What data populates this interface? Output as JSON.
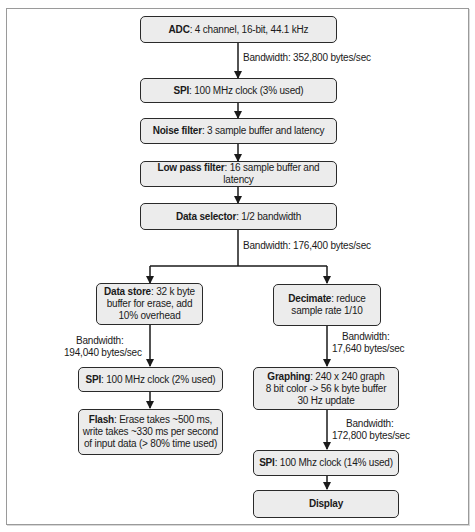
{
  "diagram": {
    "main": [
      {
        "id": "adc",
        "title": "ADC",
        "desc": ": 4 channel, 16-bit, 44.1 kHz"
      },
      {
        "id": "spi1",
        "title": "SPI",
        "desc": ": 100 MHz clock (3% used)"
      },
      {
        "id": "noise",
        "title": "Noise filter",
        "desc": ": 3 sample buffer and latency"
      },
      {
        "id": "lowpass",
        "title": "Low pass filter",
        "desc": ": 16 sample buffer and latency"
      },
      {
        "id": "selector",
        "title": "Data selector",
        "desc": ": 1/2 bandwidth"
      }
    ],
    "left": [
      {
        "id": "datastore",
        "title": "Data store",
        "desc": ": 32 k byte",
        "line2": "buffer for erase, add",
        "line3": "10% overhead"
      },
      {
        "id": "spi2",
        "title": "SPI",
        "desc": ": 100 MHz clock (2% used)"
      },
      {
        "id": "flash",
        "title": "Flash",
        "desc": ": Erase takes ~500 ms,",
        "line2": "write takes ~330 ms per second",
        "line3": "of input data (> 80% time used)"
      }
    ],
    "right": [
      {
        "id": "decimate",
        "title": "Decimate",
        "desc": ": reduce",
        "line2": "sample rate 1/10"
      },
      {
        "id": "graphing",
        "title": "Graphing",
        "desc": ": 240 x 240 graph",
        "line2": "8 bit color -> 56 k byte buffer",
        "line3": "30 Hz update"
      },
      {
        "id": "spi3",
        "title": "SPI",
        "desc": ": 100 Mhz clock (14% used)"
      },
      {
        "id": "display",
        "title": "Display",
        "desc": ""
      }
    ],
    "bandwidth_labels": {
      "adc_out": "Bandwidth: 352,800 bytes/sec",
      "selector_out": "Bandwidth: 176,400 bytes/sec",
      "datastore_out_1": "Bandwidth:",
      "datastore_out_2": "194,040 bytes/sec",
      "decimate_out_1": "Bandwidth:",
      "decimate_out_2": "17,640 bytes/sec",
      "graphing_out_1": "Bandwidth:",
      "graphing_out_2": "172,800 bytes/sec"
    },
    "colors": {
      "box_fill": "#ececec",
      "box_border": "#2a2a2a",
      "line": "#1a1a1a"
    }
  }
}
